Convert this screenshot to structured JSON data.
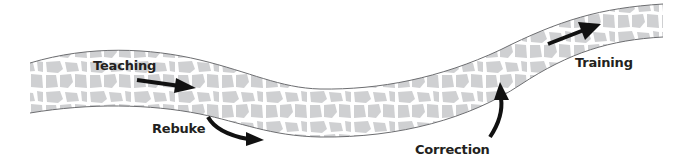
{
  "diagram": {
    "type": "path-with-arrows",
    "colors": {
      "path_outline": "#6d6e71",
      "stone_fill": "#cfd0d2",
      "mortar": "#ffffff",
      "arrow": "#111111",
      "text": "#231f20"
    },
    "labels": {
      "teaching": "Teaching",
      "rebuke": "Rebuke",
      "correction": "Correction",
      "training": "Training"
    },
    "sequence": [
      "Teaching",
      "Rebuke",
      "Correction",
      "Training"
    ]
  }
}
